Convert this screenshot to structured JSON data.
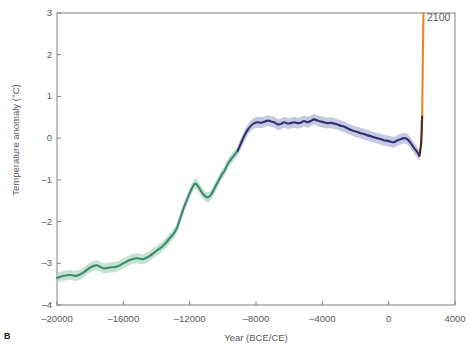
{
  "panel": {
    "label": "B"
  },
  "annotations": {
    "future_endpoint": "2100"
  },
  "colors": {
    "paleo_line": "#3a8a6b",
    "paleo_band": "#a8d3bf",
    "holocene_line": "#2d2f6e",
    "holocene_band": "#a9accf",
    "instrumental_line": "#4a2a18",
    "projection_line": "#e8862a",
    "axis": "#808285",
    "text": "#58595b"
  },
  "chart_data": {
    "type": "line",
    "title": "",
    "xlabel": "Year (BCE/CE)",
    "ylabel": "Temperature anomaly (°C)",
    "xlim": [
      -20000,
      4000
    ],
    "ylim": [
      -4,
      3
    ],
    "xticks": [
      -20000,
      -16000,
      -12000,
      -8000,
      -4000,
      0,
      4000
    ],
    "xtick_labels": [
      "–20000",
      "–16000",
      "–12000",
      "–8000",
      "–4000",
      "0",
      "4000"
    ],
    "yticks": [
      3,
      2,
      1,
      0,
      -1,
      -2,
      -3,
      -4
    ],
    "ytick_labels": [
      "3",
      "2",
      "1",
      "0",
      "–1",
      "–2",
      "–3",
      "–4"
    ],
    "grid": false,
    "legend": null,
    "series": [
      {
        "name": "Last Glacial Maximum to early Holocene reconstruction",
        "color": "#3a8a6b",
        "band_color": "#a8d3bf",
        "band_halfwidth": 0.12,
        "x": [
          -20000,
          -19600,
          -19200,
          -18800,
          -18400,
          -18000,
          -17600,
          -17200,
          -16800,
          -16400,
          -16000,
          -15600,
          -15200,
          -14800,
          -14400,
          -14000,
          -13600,
          -13200,
          -12800,
          -12400,
          -12000,
          -11700,
          -11500,
          -11300,
          -11100,
          -10900,
          -10700,
          -10500,
          -10300,
          -10100,
          -9900,
          -9700,
          -9500,
          -9300,
          -9100
        ],
        "y": [
          -3.35,
          -3.3,
          -3.28,
          -3.3,
          -3.22,
          -3.1,
          -3.05,
          -3.12,
          -3.1,
          -3.08,
          -3.0,
          -2.92,
          -2.88,
          -2.9,
          -2.82,
          -2.7,
          -2.58,
          -2.4,
          -2.18,
          -1.72,
          -1.32,
          -1.1,
          -1.15,
          -1.28,
          -1.38,
          -1.42,
          -1.35,
          -1.2,
          -1.05,
          -0.9,
          -0.78,
          -0.62,
          -0.5,
          -0.4,
          -0.3
        ]
      },
      {
        "name": "Holocene reconstruction",
        "color": "#2d2f6e",
        "band_color": "#a9accf",
        "band_halfwidth": 0.13,
        "x": [
          -9100,
          -8900,
          -8700,
          -8500,
          -8300,
          -8100,
          -7900,
          -7700,
          -7500,
          -7300,
          -7100,
          -6900,
          -6700,
          -6500,
          -6300,
          -6100,
          -5900,
          -5700,
          -5500,
          -5300,
          -5100,
          -4900,
          -4700,
          -4500,
          -4300,
          -4100,
          -3900,
          -3700,
          -3500,
          -3300,
          -3100,
          -2900,
          -2700,
          -2500,
          -2300,
          -2100,
          -1900,
          -1700,
          -1500,
          -1300,
          -1100,
          -900,
          -700,
          -500,
          -300,
          -100,
          100,
          300,
          500,
          700,
          900,
          1100,
          1300,
          1500,
          1700,
          1850
        ],
        "y": [
          -0.3,
          -0.12,
          0.06,
          0.2,
          0.3,
          0.36,
          0.38,
          0.37,
          0.39,
          0.42,
          0.4,
          0.38,
          0.33,
          0.34,
          0.38,
          0.35,
          0.36,
          0.38,
          0.36,
          0.37,
          0.41,
          0.38,
          0.41,
          0.45,
          0.42,
          0.4,
          0.38,
          0.36,
          0.37,
          0.35,
          0.33,
          0.3,
          0.28,
          0.24,
          0.2,
          0.17,
          0.15,
          0.12,
          0.1,
          0.07,
          0.05,
          0.02,
          0.0,
          -0.02,
          -0.05,
          -0.06,
          -0.08,
          -0.1,
          -0.06,
          -0.03,
          0.0,
          -0.02,
          -0.1,
          -0.22,
          -0.32,
          -0.42
        ]
      },
      {
        "name": "Instrumental record",
        "color": "#4a2a18",
        "band_color": null,
        "x": [
          1850,
          1900,
          1950,
          1980,
          2000,
          2020
        ],
        "y": [
          -0.42,
          -0.3,
          -0.15,
          0.05,
          0.3,
          0.55
        ]
      },
      {
        "name": "Future projection to 2100",
        "color": "#e8862a",
        "band_color": null,
        "x": [
          2020,
          2040,
          2060,
          2080,
          2100
        ],
        "y": [
          0.55,
          1.2,
          1.85,
          2.45,
          3.0
        ]
      }
    ]
  }
}
